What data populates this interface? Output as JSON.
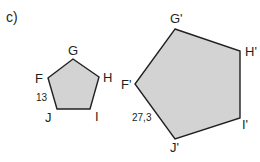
{
  "part_label": "c)",
  "colors": {
    "fill": "#d3d3d3",
    "stroke": "#231f20",
    "text": "#231f20",
    "background": "#ffffff"
  },
  "small_pentagon": {
    "vertices": [
      {
        "name": "G",
        "x": 73,
        "y": 59
      },
      {
        "name": "H",
        "x": 99,
        "y": 77
      },
      {
        "name": "I",
        "x": 90,
        "y": 109
      },
      {
        "name": "J",
        "x": 57,
        "y": 109
      },
      {
        "name": "F",
        "x": 48,
        "y": 78
      }
    ],
    "labels": {
      "G": "G",
      "H": "H",
      "I": "I",
      "J": "J",
      "F": "F"
    },
    "side_label": "13",
    "side": "FJ"
  },
  "large_pentagon": {
    "vertices": [
      {
        "name": "G'",
        "x": 175,
        "y": 29
      },
      {
        "name": "H'",
        "x": 240,
        "y": 51
      },
      {
        "name": "I'",
        "x": 240,
        "y": 118
      },
      {
        "name": "J'",
        "x": 175,
        "y": 139
      },
      {
        "name": "F'",
        "x": 135,
        "y": 84
      }
    ],
    "labels": {
      "G": "G'",
      "H": "H'",
      "I": "I'",
      "J": "J'",
      "F": "F'"
    },
    "side_label": "27,3",
    "side": "F'J'"
  }
}
